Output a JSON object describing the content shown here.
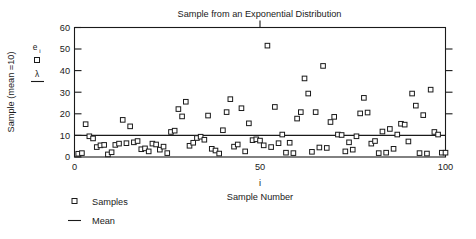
{
  "chart_data": {
    "type": "scatter",
    "title": "Sample from an Exponential Distribution",
    "xlabel": "Sample Number",
    "xlabel_symbol": "i",
    "ylabel": "Sample (mean =10)",
    "xlim": [
      0,
      100
    ],
    "ylim": [
      0,
      60
    ],
    "xticks": [
      0,
      50,
      100
    ],
    "xticklabels": [
      "0",
      "50",
      "100"
    ],
    "yticks": [
      0,
      10,
      20,
      30,
      40,
      50,
      60
    ],
    "yticklabels": [
      "0",
      "10",
      "20",
      "30",
      "40",
      "50",
      "60"
    ],
    "grid": false,
    "legend_position": "below-left",
    "series": [
      {
        "name": "Samples",
        "marker": "open-square",
        "x": [
          1,
          2,
          3,
          4,
          5,
          6,
          7,
          8,
          9,
          10,
          11,
          12,
          13,
          14,
          15,
          16,
          17,
          18,
          19,
          20,
          21,
          22,
          23,
          24,
          25,
          26,
          27,
          28,
          29,
          30,
          31,
          32,
          33,
          34,
          35,
          36,
          37,
          38,
          39,
          40,
          41,
          42,
          43,
          44,
          45,
          46,
          47,
          48,
          49,
          50,
          51,
          52,
          53,
          54,
          55,
          56,
          57,
          58,
          59,
          60,
          61,
          62,
          63,
          64,
          65,
          66,
          67,
          68,
          69,
          70,
          71,
          72,
          73,
          74,
          75,
          76,
          77,
          78,
          79,
          80,
          81,
          82,
          83,
          84,
          85,
          86,
          87,
          88,
          89,
          90,
          91,
          92,
          93,
          94,
          95,
          96,
          97,
          98,
          99,
          100
        ],
        "y": [
          1.5,
          1.8,
          15.2,
          9.6,
          8.6,
          4.6,
          5.4,
          5.6,
          1.2,
          2.2,
          5.6,
          6.2,
          17.2,
          6.4,
          14.2,
          6.8,
          7.4,
          3.6,
          4.0,
          2.6,
          6.2,
          5.8,
          3.4,
          4.8,
          1.8,
          11.6,
          12.2,
          22.2,
          18.8,
          25.6,
          5.2,
          6.6,
          8.8,
          9.4,
          8.0,
          19.2,
          3.8,
          3.0,
          1.6,
          12.4,
          20.8,
          26.8,
          4.8,
          5.8,
          22.6,
          2.6,
          15.6,
          7.8,
          8.2,
          7.6,
          5.4,
          51.6,
          4.6,
          23.2,
          6.4,
          10.4,
          2.0,
          6.6,
          1.8,
          17.8,
          20.8,
          36.4,
          29.4,
          2.4,
          20.8,
          4.4,
          42.2,
          4.2,
          16.2,
          18.6,
          10.4,
          10.2,
          2.6,
          6.8,
          3.4,
          9.6,
          20.2,
          27.4,
          20.6,
          6.2,
          7.4,
          1.8,
          11.8,
          2.0,
          13.0,
          3.8,
          10.4,
          15.4,
          15.0,
          7.2,
          29.4,
          23.8,
          1.8,
          19.4,
          1.6,
          31.2,
          11.6,
          10.4,
          2.0,
          2.0
        ]
      },
      {
        "name": "Mean",
        "marker": "line",
        "value": 10
      }
    ],
    "annotations": [
      {
        "symbol": "e",
        "subscript": "i",
        "marker": "open-square"
      },
      {
        "symbol": "λ",
        "marker": "line"
      }
    ]
  },
  "legend": {
    "items": [
      {
        "label": "Samples",
        "marker": "open-square"
      },
      {
        "label": "Mean",
        "marker": "line"
      }
    ]
  },
  "colors": {
    "ink": "#1a1a1a",
    "background": "#ffffff",
    "marker_fill": "#ffffff"
  }
}
